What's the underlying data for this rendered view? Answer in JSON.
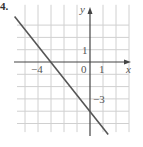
{
  "question_number": "4.",
  "chart_data": {
    "type": "line",
    "title": "",
    "xlabel": "x",
    "ylabel": "y",
    "xlim": [
      -6,
      3
    ],
    "ylim": [
      -6,
      5
    ],
    "grid": true,
    "tick_labels": {
      "x": [
        {
          "value": -4,
          "label": "−4"
        },
        {
          "value": 0,
          "label": "0"
        },
        {
          "value": 1,
          "label": "1"
        }
      ],
      "y": [
        {
          "value": 1,
          "label": "1"
        },
        {
          "value": -3,
          "label": "−3"
        }
      ]
    },
    "series": [
      {
        "name": "line",
        "equation": "y = -4/3 x - 4",
        "points": [
          {
            "x": -5.8,
            "y": 3.7
          },
          {
            "x": -3,
            "y": 0
          },
          {
            "x": 0,
            "y": -4
          },
          {
            "x": 1.4,
            "y": -5.9
          }
        ]
      }
    ],
    "colors": {
      "line": "#555555",
      "grid": "#d0d0d0",
      "axis": "#444444"
    }
  }
}
